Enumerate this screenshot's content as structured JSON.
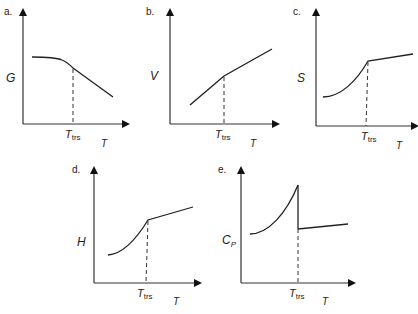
{
  "diagram": {
    "panels": [
      {
        "id": "a",
        "letter": "a.",
        "ylabel": "G",
        "xlabel": "T",
        "marker_main": "T",
        "marker_sub": "trs",
        "behavior": "G decreases; slope changes at transition"
      },
      {
        "id": "b",
        "letter": "b.",
        "ylabel": "V",
        "xlabel": "T",
        "marker_main": "T",
        "marker_sub": "trs",
        "behavior": "V increases; slope changes at transition"
      },
      {
        "id": "c",
        "letter": "c.",
        "ylabel": "S",
        "xlabel": "T",
        "marker_main": "T",
        "marker_sub": "trs",
        "behavior": "S rises, slope kink at transition"
      },
      {
        "id": "d",
        "letter": "d.",
        "ylabel": "H",
        "xlabel": "T",
        "marker_main": "T",
        "marker_sub": "trs",
        "behavior": "H rises, slope kink at transition"
      },
      {
        "id": "e",
        "letter": "e.",
        "ylabel": "C",
        "ylabel_sub": "P",
        "xlabel": "T",
        "marker_main": "T",
        "marker_sub": "trs",
        "behavior": "Cp rises sharply then drops discontinuously at transition"
      }
    ]
  }
}
